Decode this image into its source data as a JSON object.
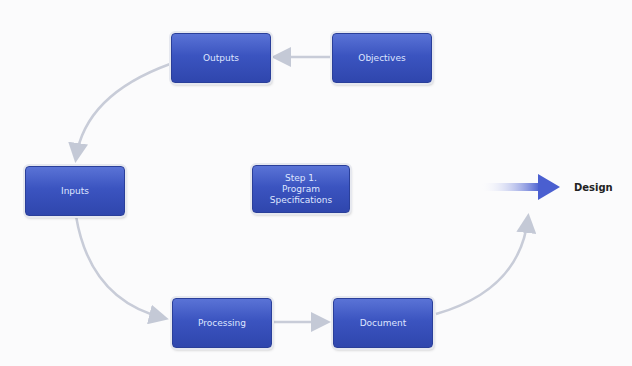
{
  "diagram": {
    "nodes": [
      {
        "id": "objectives",
        "label": "Objectives"
      },
      {
        "id": "outputs",
        "label": "Outputs"
      },
      {
        "id": "inputs",
        "label": "Inputs"
      },
      {
        "id": "center",
        "label": "Step 1. Program Specifications"
      },
      {
        "id": "processing",
        "label": "Processing"
      },
      {
        "id": "document",
        "label": "Document"
      }
    ],
    "edges": [
      [
        "objectives",
        "outputs"
      ],
      [
        "outputs",
        "inputs"
      ],
      [
        "inputs",
        "processing"
      ],
      [
        "processing",
        "document"
      ],
      [
        "document",
        "design"
      ]
    ],
    "next_step": {
      "label": "Design"
    },
    "colors": {
      "box": "#3b54c0",
      "arrow": "#c8ccd8",
      "accent_arrow": "#4a5fd0"
    }
  }
}
